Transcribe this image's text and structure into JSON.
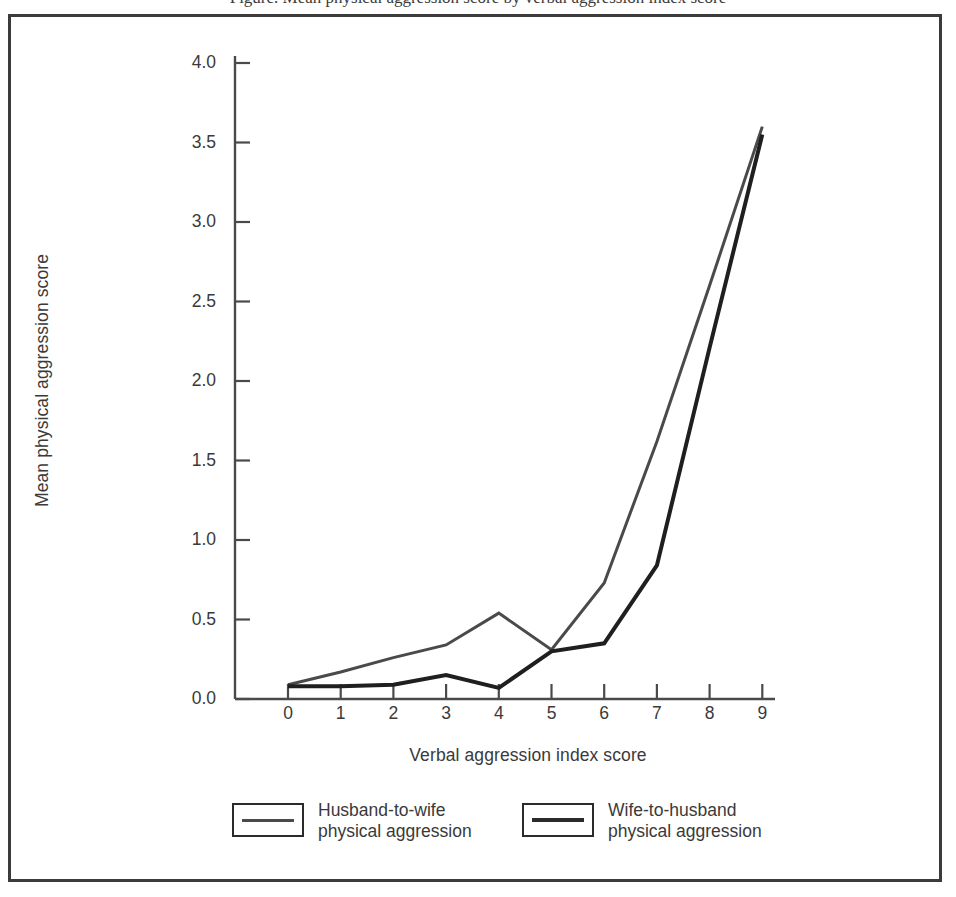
{
  "caption": {
    "text": "Figure. Mean physical aggression score by verbal aggression index score"
  },
  "colors": {
    "series_husband": "#4a4a4a",
    "series_wife": "#1f1f1f",
    "axis": "#4a4a4a",
    "frame": "#3b3b3b",
    "text": "#3a3a3a"
  },
  "chart_data": {
    "type": "line",
    "title": "",
    "xlabel": "Verbal aggression index score",
    "ylabel": "Mean physical aggression score",
    "x": [
      0,
      1,
      2,
      3,
      4,
      5,
      6,
      7,
      8,
      9
    ],
    "xticklabels": [
      "0",
      "1",
      "2",
      "3",
      "4",
      "5",
      "6",
      "7",
      "8",
      "9"
    ],
    "yticks": [
      0.0,
      0.5,
      1.0,
      1.5,
      2.0,
      2.5,
      3.0,
      3.5,
      4.0
    ],
    "yticklabels": [
      "0.0",
      "0.5",
      "1.0",
      "1.5",
      "2.0",
      "2.5",
      "3.0",
      "3.5",
      "4.0"
    ],
    "xlim": [
      0,
      9
    ],
    "ylim": [
      0.0,
      4.0
    ],
    "grid": false,
    "legend_position": "below",
    "series": [
      {
        "name": "Husband-to-wife physical aggression",
        "legend_line1": "Husband-to-wife",
        "legend_line2": "physical aggression",
        "color": "#4a4a4a",
        "width": 3,
        "values": [
          0.09,
          0.17,
          0.26,
          0.34,
          0.54,
          0.31,
          0.73,
          1.62,
          2.6,
          3.6
        ]
      },
      {
        "name": "Wife-to-husband physical aggression",
        "legend_line1": "Wife-to-husband",
        "legend_line2": "physical aggression",
        "color": "#1f1f1f",
        "width": 4,
        "values": [
          0.08,
          0.08,
          0.09,
          0.15,
          0.07,
          0.3,
          0.35,
          0.84,
          2.21,
          3.55
        ]
      }
    ]
  }
}
